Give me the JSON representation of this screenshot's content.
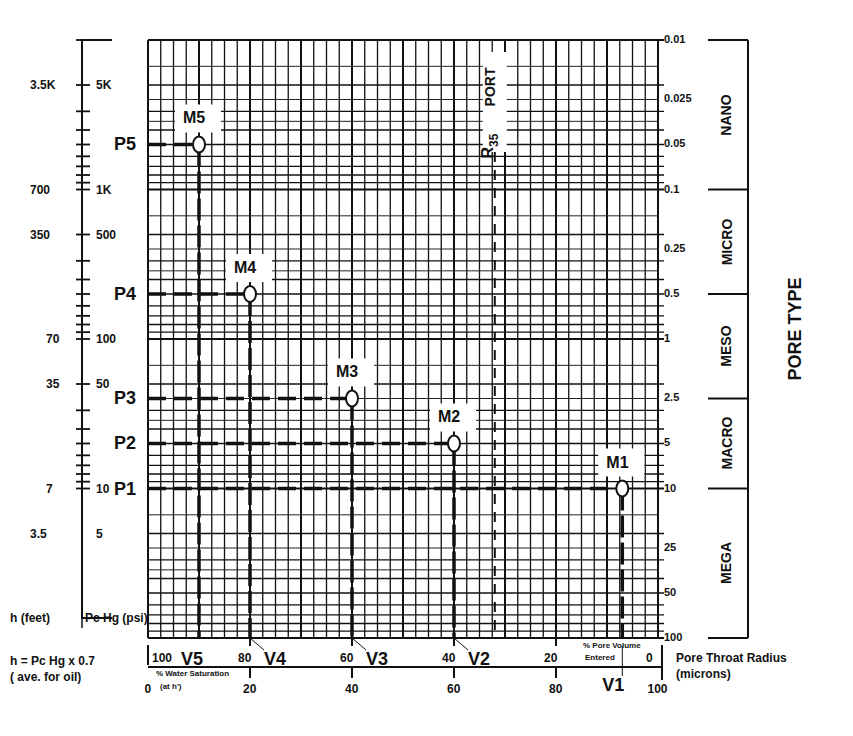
{
  "chart_data": {
    "type": "line",
    "xlabel": "% Pore Volume Entered",
    "x2label": "% Water Saturation (at h')",
    "ylabel_left_outer": "h (feet)",
    "ylabel_left_inner": "Pc Hg (psi)",
    "ylabel_right": "Pore Throat Radius (microns)",
    "right_title": "PORE TYPE",
    "formula": "h = Pc Hg x 0.7",
    "formula_note": "( ave. for oil)",
    "y_scale": "log",
    "grid": true,
    "pv_ticks": [
      "100",
      "80",
      "60",
      "40",
      "20",
      "0"
    ],
    "sw_ticks": [
      "0",
      "20",
      "40",
      "60",
      "80",
      "100"
    ],
    "right_ticks": [
      "0.01",
      "0.025",
      "0.05",
      "0.1",
      "0.25",
      "0.5",
      "1",
      "2.5",
      "5",
      "10",
      "25",
      "50",
      "100"
    ],
    "pc_ticks": [
      "5K",
      "1K",
      "500",
      "100",
      "50",
      "10",
      "5"
    ],
    "h_ticks": [
      "3.5K",
      "700",
      "350",
      "70",
      "35",
      "7",
      "3.5"
    ],
    "pore_types": [
      {
        "name": "NANO",
        "from": 0.01,
        "to": 0.1
      },
      {
        "name": "MICRO",
        "from": 0.1,
        "to": 0.5
      },
      {
        "name": "MESO",
        "from": 0.5,
        "to": 2.5
      },
      {
        "name": "MACRO",
        "from": 2.5,
        "to": 10
      },
      {
        "name": "MEGA",
        "from": 10,
        "to": 100
      }
    ],
    "r35_label": "PORT",
    "r35_prefix": "R",
    "r35_sub": "35",
    "r35_x_pv": 32,
    "points": [
      {
        "name": "M1",
        "p_label": "P1",
        "v_label": "V1",
        "pv_entered": 7,
        "pc_psi": 10,
        "radius_um": 10
      },
      {
        "name": "M2",
        "p_label": "P2",
        "v_label": "V2",
        "pv_entered": 40,
        "pc_psi": 20,
        "radius_um": 5
      },
      {
        "name": "M3",
        "p_label": "P3",
        "v_label": "V3",
        "pv_entered": 60,
        "pc_psi": 50,
        "radius_um": 2.5
      },
      {
        "name": "M4",
        "p_label": "P4",
        "v_label": "V4",
        "pv_entered": 80,
        "pc_psi": 200,
        "radius_um": 0.5
      },
      {
        "name": "M5",
        "p_label": "P5",
        "v_label": "V5",
        "pv_entered": 90,
        "pc_psi": 2000,
        "radius_um": 0.05
      }
    ]
  },
  "labels": {
    "h_axis": "h (feet)",
    "pc_axis": "Pc Hg (psi)",
    "formula": "h = Pc Hg x 0.7",
    "formula_note": "( ave. for oil)",
    "sw_title": "% Water Saturation",
    "sw_sub": "(at h')",
    "pv_title1": "% Pore Volume",
    "pv_title2": "Entered",
    "ptr1": "Pore Throat Radius",
    "ptr2": "(microns)",
    "pore_type": "PORE TYPE"
  }
}
